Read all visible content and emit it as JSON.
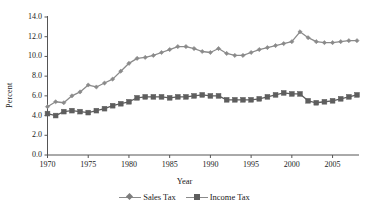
{
  "chart_data": {
    "type": "line",
    "title": "",
    "xlabel": "Year",
    "ylabel": "Percent",
    "xlim": [
      1970,
      2008
    ],
    "ylim": [
      0.0,
      14.0
    ],
    "ytick_labels": [
      "14.0",
      "12.0",
      "10.0",
      "8.0",
      "6.0",
      "4.0",
      "2.0",
      "0.0"
    ],
    "ytick_values": [
      14.0,
      12.0,
      10.0,
      8.0,
      6.0,
      4.0,
      2.0,
      0.0
    ],
    "xtick_labels": [
      "1970",
      "1975",
      "1980",
      "1985",
      "1990",
      "1995",
      "2000",
      "2005"
    ],
    "xtick_values": [
      1970,
      1975,
      1980,
      1985,
      1990,
      1995,
      2000,
      2005
    ],
    "grid": false,
    "legend_position": "bottom",
    "x": [
      1970,
      1971,
      1972,
      1973,
      1974,
      1975,
      1976,
      1977,
      1978,
      1979,
      1980,
      1981,
      1982,
      1983,
      1984,
      1985,
      1986,
      1987,
      1988,
      1989,
      1990,
      1991,
      1992,
      1993,
      1994,
      1995,
      1996,
      1997,
      1998,
      1999,
      2000,
      2001,
      2002,
      2003,
      2004,
      2005,
      2006,
      2007,
      2008
    ],
    "series": [
      {
        "name": "Sales Tax",
        "marker": "diamond",
        "color": "#8a8a8a",
        "values": [
          4.9,
          5.4,
          5.3,
          6.0,
          6.4,
          7.1,
          6.9,
          7.3,
          7.7,
          8.5,
          9.3,
          9.8,
          9.9,
          10.1,
          10.4,
          10.7,
          11.0,
          11.0,
          10.8,
          10.5,
          10.4,
          10.8,
          10.3,
          10.1,
          10.1,
          10.4,
          10.7,
          10.9,
          11.1,
          11.3,
          11.5,
          12.5,
          11.9,
          11.5,
          11.4,
          11.4,
          11.5,
          11.6,
          11.6
        ]
      },
      {
        "name": "Income Tax",
        "marker": "square",
        "color": "#5e5e5e",
        "values": [
          4.2,
          4.0,
          4.4,
          4.5,
          4.4,
          4.3,
          4.5,
          4.7,
          5.0,
          5.2,
          5.4,
          5.8,
          5.9,
          5.9,
          5.9,
          5.8,
          5.9,
          5.9,
          6.0,
          6.1,
          6.0,
          6.0,
          5.6,
          5.6,
          5.6,
          5.6,
          5.7,
          5.9,
          6.1,
          6.3,
          6.2,
          6.2,
          5.5,
          5.3,
          5.4,
          5.5,
          5.7,
          5.9,
          6.1
        ]
      }
    ]
  },
  "legend": {
    "entries": [
      {
        "label": "Sales Tax"
      },
      {
        "label": "Income Tax"
      }
    ]
  }
}
